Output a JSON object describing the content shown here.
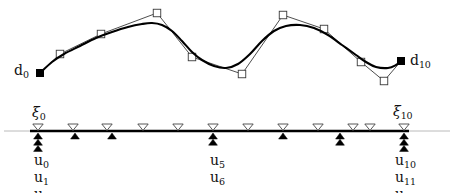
{
  "figure": {
    "type": "bspline-curve-with-knot-vector",
    "background_color": "#ffffff",
    "curve_color": "#000000",
    "polygon_color": "#3a3a3a",
    "axis_color": "#a8a8a8",
    "knotline_color": "#000000",
    "width": 454,
    "height": 193
  },
  "labels": {
    "d0": {
      "base": "d",
      "sub": "0",
      "x": 14,
      "y": 62
    },
    "d10": {
      "base": "d",
      "sub": "10",
      "x": 410,
      "y": 52
    },
    "xi0": {
      "base": "ξ",
      "sub": "0",
      "x": 32,
      "y": 104
    },
    "xi10": {
      "base": "ξ",
      "sub": "10",
      "x": 393,
      "y": 103
    },
    "u_left": [
      {
        "base": "u",
        "sub": "0"
      },
      {
        "base": "u",
        "sub": "1"
      },
      {
        "base": "u",
        "sub": "2"
      }
    ],
    "u_mid": [
      {
        "base": "u",
        "sub": "5"
      },
      {
        "base": "u",
        "sub": "6"
      }
    ],
    "u_right": [
      {
        "base": "u",
        "sub": "10"
      },
      {
        "base": "u",
        "sub": "11"
      },
      {
        "base": "u",
        "sub": "12"
      }
    ],
    "u_left_x": 34,
    "u_left_y": 152,
    "u_mid_x": 210,
    "u_mid_y": 152,
    "u_right_x": 395,
    "u_right_y": 152,
    "u_line_step": 17
  },
  "chart_data": {
    "type": "line",
    "title": "",
    "xlabel": "",
    "ylabel": "",
    "grid": false,
    "legend": "none",
    "xlim": [
      0,
      454
    ],
    "ylim": [
      193,
      0
    ],
    "series": [
      {
        "name": "control-polygon",
        "marker": "square",
        "points": [
          {
            "x": 40,
            "y": 73,
            "filled": true,
            "label": "d0"
          },
          {
            "x": 60,
            "y": 54,
            "filled": false
          },
          {
            "x": 101,
            "y": 34,
            "filled": false
          },
          {
            "x": 157,
            "y": 13,
            "filled": false
          },
          {
            "x": 192,
            "y": 57,
            "filled": false
          },
          {
            "x": 242,
            "y": 74,
            "filled": false
          },
          {
            "x": 283,
            "y": 15,
            "filled": false
          },
          {
            "x": 324,
            "y": 29,
            "filled": false
          },
          {
            "x": 361,
            "y": 62,
            "filled": false
          },
          {
            "x": 384,
            "y": 81,
            "filled": false
          },
          {
            "x": 401,
            "y": 61,
            "filled": true,
            "label": "d10"
          }
        ]
      },
      {
        "name": "bspline-curve",
        "marker": "none",
        "points": [
          {
            "x": 40,
            "y": 73
          },
          {
            "x": 52,
            "y": 62
          },
          {
            "x": 64,
            "y": 54
          },
          {
            "x": 80,
            "y": 46
          },
          {
            "x": 96,
            "y": 38
          },
          {
            "x": 112,
            "y": 32
          },
          {
            "x": 128,
            "y": 27
          },
          {
            "x": 142,
            "y": 24
          },
          {
            "x": 152,
            "y": 23
          },
          {
            "x": 162,
            "y": 25
          },
          {
            "x": 172,
            "y": 31
          },
          {
            "x": 182,
            "y": 41
          },
          {
            "x": 192,
            "y": 52
          },
          {
            "x": 202,
            "y": 60
          },
          {
            "x": 214,
            "y": 66
          },
          {
            "x": 226,
            "y": 68
          },
          {
            "x": 238,
            "y": 64
          },
          {
            "x": 250,
            "y": 54
          },
          {
            "x": 262,
            "y": 41
          },
          {
            "x": 274,
            "y": 31
          },
          {
            "x": 286,
            "y": 26
          },
          {
            "x": 300,
            "y": 25
          },
          {
            "x": 314,
            "y": 28
          },
          {
            "x": 328,
            "y": 35
          },
          {
            "x": 342,
            "y": 45
          },
          {
            "x": 356,
            "y": 55
          },
          {
            "x": 366,
            "y": 62
          },
          {
            "x": 376,
            "y": 67
          },
          {
            "x": 388,
            "y": 68
          },
          {
            "x": 396,
            "y": 65
          },
          {
            "x": 401,
            "y": 61
          }
        ]
      }
    ],
    "knot_line": {
      "y": 131,
      "x_start": 30,
      "x_end": 409,
      "axis_x_start": 4,
      "axis_x_end": 450
    },
    "xi_markers": {
      "symbol": "open-triangle-down",
      "x": [
        38,
        73,
        107,
        143,
        178,
        213,
        248,
        283,
        318,
        353,
        370,
        404
      ]
    },
    "u_markers": {
      "symbol": "filled-triangle-up",
      "clusters": [
        {
          "x": 38,
          "count": 3,
          "labels": [
            "u0",
            "u1",
            "u2"
          ]
        },
        {
          "x": 75,
          "count": 1,
          "labels": [
            "u3"
          ]
        },
        {
          "x": 112,
          "count": 1,
          "labels": [
            "u4"
          ]
        },
        {
          "x": 213,
          "count": 2,
          "labels": [
            "u5",
            "u6"
          ]
        },
        {
          "x": 283,
          "count": 1,
          "labels": [
            "u7"
          ]
        },
        {
          "x": 340,
          "count": 2,
          "labels": [
            "u8",
            "u9"
          ]
        },
        {
          "x": 404,
          "count": 3,
          "labels": [
            "u10",
            "u11",
            "u12"
          ]
        }
      ]
    }
  }
}
